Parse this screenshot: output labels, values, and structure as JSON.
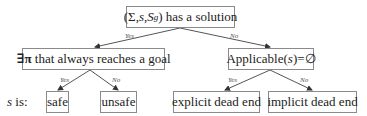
{
  "diagram": {
    "root": {
      "prefix": "(Σ,",
      "var_s": "s",
      "comma": ",",
      "var_S": "S",
      "sub_g": "g",
      "suffix": ") has a solution"
    },
    "left_question": {
      "symbol": "∃π",
      "text": " that always reaches a goal"
    },
    "right_question": {
      "prefix": "Applicable(",
      "var": "s",
      "suffix": ")=∅"
    },
    "leaves": {
      "safe": "safe",
      "unsafe": "unsafe",
      "explicit": "explicit dead end",
      "implicit": "implicit dead end"
    },
    "row_label": {
      "var": "s",
      "text": " is:"
    },
    "edge_labels": {
      "root_yes": "Yes",
      "root_no": "No",
      "left_yes": "Yes",
      "left_no": "No",
      "right_yes": "Yes",
      "right_no": "No"
    },
    "colors": {
      "border": "#8a8a8a",
      "edge": "#444444",
      "text": "#222222"
    }
  }
}
